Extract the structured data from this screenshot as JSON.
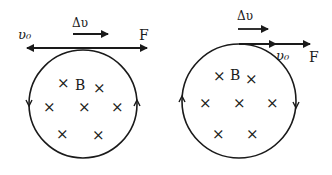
{
  "diagrams": [
    {
      "name": "left",
      "labels": {
        "v0": "υ₀",
        "dv": "Δυ",
        "force": "F",
        "field": "B"
      },
      "field_marker": "×",
      "circulation": "counterclockwise"
    },
    {
      "name": "right",
      "labels": {
        "v0": "υ₀",
        "dv": "Δυ",
        "force": "F",
        "field": "B"
      },
      "field_marker": "×",
      "circulation": "clockwise"
    }
  ],
  "colors": {
    "ink": "#1a1a1a",
    "background": "#ffffff"
  }
}
